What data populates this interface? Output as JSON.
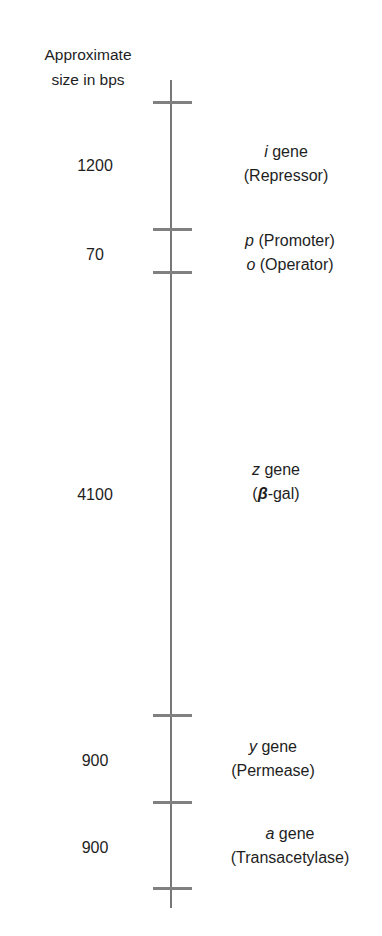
{
  "diagram": {
    "axis_title_line1": "Approximate",
    "axis_title_line2": "size in bps",
    "ticks_y": [
      102,
      230,
      273,
      715,
      803,
      889
    ],
    "segments": [
      {
        "size": "1200",
        "symbol": "i",
        "name_suffix": " gene",
        "desc": "(Repressor)"
      },
      {
        "size": "70",
        "p_symbol": "p",
        "p_desc": " (Promoter)",
        "o_symbol": "o",
        "o_desc": " (Operator)"
      },
      {
        "size": "4100",
        "symbol": "z",
        "name_suffix": " gene",
        "desc_open": "(",
        "desc_beta": "β",
        "desc_rest": "-gal)"
      },
      {
        "size": "900",
        "symbol": "y",
        "name_suffix": " gene",
        "desc": "(Permease)"
      },
      {
        "size": "900",
        "symbol": "a",
        "name_suffix": " gene",
        "desc": "(Transacetylase)"
      }
    ],
    "colors": {
      "line": "#777777",
      "text": "#1e1e1e"
    }
  }
}
